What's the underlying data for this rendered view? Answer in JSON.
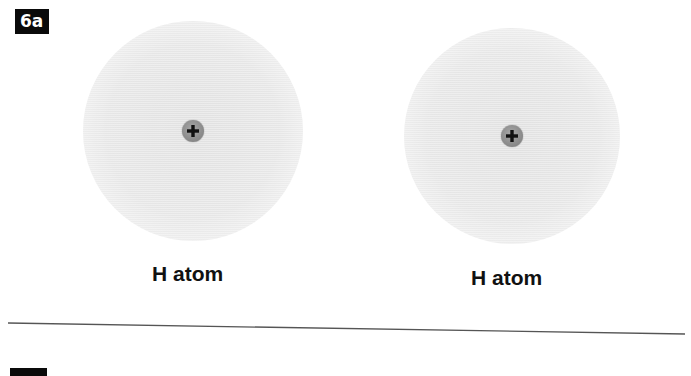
{
  "figure": {
    "panel_label": "6a",
    "atoms": [
      {
        "label": "H atom",
        "nucleus_charge": "+",
        "center": [
          193,
          131
        ],
        "cloud_radius": 110
      },
      {
        "label": "H atom",
        "nucleus_charge": "+",
        "center": [
          512,
          136
        ],
        "cloud_radius": 108
      }
    ],
    "colors": {
      "label_box_bg": "#0a0a0a",
      "label_box_text": "#ffffff",
      "cloud": "#d2d2d2",
      "nucleus": "#8c8c8c",
      "plus_sign": "#111111",
      "divider": "#555555",
      "text": "#111111"
    }
  }
}
